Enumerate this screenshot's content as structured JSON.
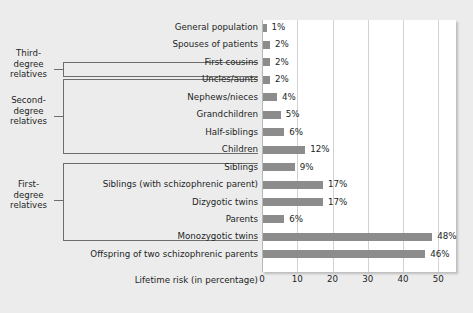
{
  "chart_data": {
    "type": "bar",
    "orientation": "horizontal",
    "title": "",
    "xlabel": "Lifetime risk (in percentage)",
    "ylabel": "",
    "xlim": [
      0,
      55
    ],
    "xticks": [
      0,
      10,
      20,
      30,
      40,
      50
    ],
    "xtick_labels": [
      "0",
      "10",
      "20",
      "30",
      "40",
      "50"
    ],
    "grid": true,
    "legend": false,
    "unit_suffix": "%",
    "bar_color": "#8d8c8c",
    "plot_background": "#ffffff",
    "figure_background": "#edecec",
    "gridline_color": "#d3d2d2",
    "text_color": "#211f1f",
    "categories": [
      "General population",
      "Spouses of patients",
      "First cousins",
      "Uncles/aunts",
      "Nephews/nieces",
      "Grandchildren",
      "Half-siblings",
      "Children",
      "Siblings",
      "Siblings (with schizophrenic parent)",
      "Dizygotic twins",
      "Parents",
      "Monozygotic twins",
      "Offspring of two schizophrenic parents"
    ],
    "values": [
      1,
      2,
      2,
      2,
      4,
      5,
      6,
      12,
      9,
      17,
      17,
      6,
      48,
      46
    ],
    "value_labels": [
      "1%",
      "2%",
      "2%",
      "2%",
      "4%",
      "5%",
      "6%",
      "12%",
      "9%",
      "17%",
      "17%",
      "6%",
      "48%",
      "46%"
    ],
    "annotations": [
      {
        "label": "Third-degree relatives",
        "label_lines": [
          "Third-",
          "degree",
          "relatives"
        ],
        "covers": [
          "First cousins"
        ]
      },
      {
        "label": "Second-degree relatives",
        "label_lines": [
          "Second-",
          "degree",
          "relatives"
        ],
        "covers": [
          "Uncles/aunts",
          "Nephews/nieces",
          "Grandchildren",
          "Half-siblings"
        ]
      },
      {
        "label": "First-degree relatives",
        "label_lines": [
          "First-",
          "degree",
          "relatives"
        ],
        "covers": [
          "Children",
          "Siblings",
          "Siblings (with schizophrenic parent)",
          "Dizygotic twins",
          "Parents"
        ]
      }
    ]
  }
}
